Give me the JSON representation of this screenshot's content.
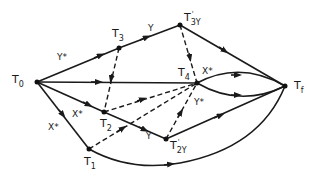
{
  "diagram": {
    "nodes": [
      {
        "id": "T0",
        "main": "T",
        "sub": "0",
        "prime": "",
        "x": 37,
        "y": 82
      },
      {
        "id": "T3",
        "main": "T",
        "sub": "3",
        "prime": "",
        "x": 119,
        "y": 48
      },
      {
        "id": "T3Y",
        "main": "T",
        "sub": "3Y",
        "prime": "'",
        "x": 180,
        "y": 25
      },
      {
        "id": "T4",
        "main": "T",
        "sub": "4",
        "prime": "",
        "x": 197,
        "y": 83
      },
      {
        "id": "Tf",
        "main": "T",
        "sub": "f",
        "prime": "",
        "x": 285,
        "y": 86
      },
      {
        "id": "T2",
        "main": "T",
        "sub": "2",
        "prime": "",
        "x": 104,
        "y": 112
      },
      {
        "id": "T1",
        "main": "T",
        "sub": "1",
        "prime": "",
        "x": 89,
        "y": 149
      },
      {
        "id": "T2Y",
        "main": "T",
        "sub": "2Y",
        "prime": "'",
        "x": 166,
        "y": 139
      }
    ],
    "edge_labels": {
      "t0_t3": "Y*",
      "t3_t3y": "Y",
      "t0_t2": "X*",
      "t0_t1": "X*",
      "t2_t2y": "Y",
      "t4_x": "X*",
      "t4_y": "Y*"
    },
    "edges": [
      {
        "from": "T0",
        "to": "T3",
        "style": "solid",
        "label": "Y*"
      },
      {
        "from": "T3",
        "to": "T3Y",
        "style": "solid",
        "label": "Y"
      },
      {
        "from": "T3Y",
        "to": "Tf",
        "style": "solid"
      },
      {
        "from": "T0",
        "to": "T4",
        "style": "solid"
      },
      {
        "from": "T4",
        "to": "Tf",
        "style": "solid",
        "curve": "upper",
        "label": "X*"
      },
      {
        "from": "T4",
        "to": "Tf",
        "style": "solid",
        "curve": "lower"
      },
      {
        "from": "T0",
        "to": "T2",
        "style": "solid",
        "label": "X*"
      },
      {
        "from": "T2",
        "to": "T2Y",
        "style": "solid",
        "label": "Y"
      },
      {
        "from": "T2Y",
        "to": "Tf",
        "style": "solid"
      },
      {
        "from": "T0",
        "to": "T1",
        "style": "solid",
        "label": "X*"
      },
      {
        "from": "T1",
        "to": "Tf",
        "style": "solid",
        "curve": "lower"
      },
      {
        "from": "T3",
        "to": "T2",
        "style": "dashed"
      },
      {
        "from": "T3Y",
        "to": "T4",
        "style": "dashed"
      },
      {
        "from": "T2",
        "to": "T4",
        "style": "dashed"
      },
      {
        "from": "T1",
        "to": "T4",
        "style": "dashed"
      },
      {
        "from": "T2Y",
        "to": "T4",
        "style": "dashed",
        "label": "Y*"
      }
    ]
  }
}
